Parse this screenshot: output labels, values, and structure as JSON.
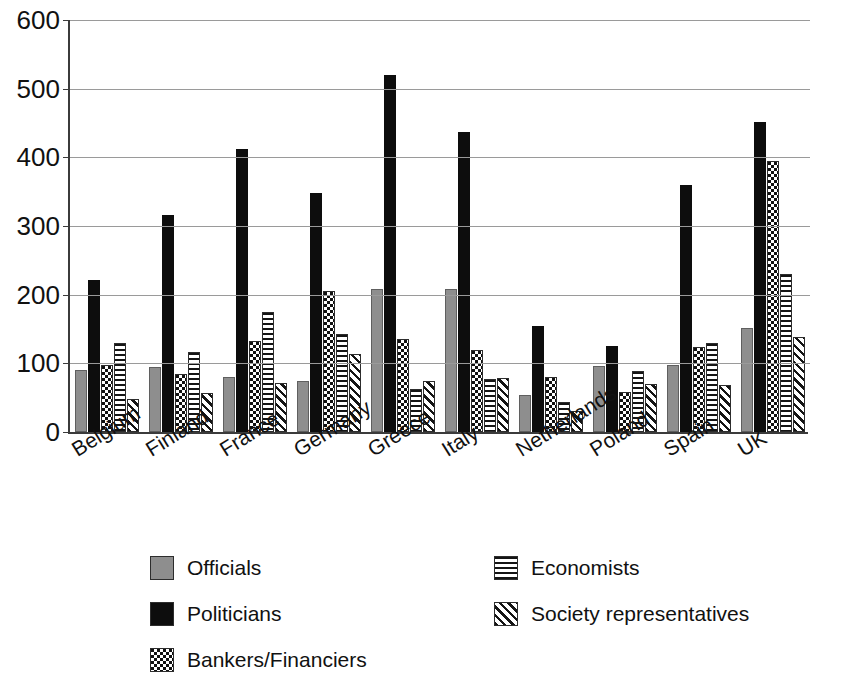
{
  "chart_data": {
    "type": "bar",
    "title": "",
    "subtitle": "",
    "xlabel": "",
    "ylabel": "",
    "ylim": [
      0,
      600
    ],
    "ytick_step": 100,
    "yticks": [
      0,
      100,
      200,
      300,
      400,
      500,
      600
    ],
    "ytick_labels": [
      "0",
      "100",
      "200",
      "300",
      "400",
      "500",
      "600"
    ],
    "grid": "horizontal",
    "legend_position": "bottom",
    "orientation": "vertical",
    "categories": [
      "Belgium",
      "Finland",
      "France",
      "Germany",
      "Greece",
      "Italy",
      "Netherlands",
      "Poland",
      "Spain",
      "UK"
    ],
    "series": [
      {
        "name": "Officials",
        "pattern": "solid-gray",
        "color": "#8e8e8e",
        "values": [
          90,
          94,
          80,
          74,
          208,
          208,
          54,
          96,
          98,
          152
        ]
      },
      {
        "name": "Politicians",
        "pattern": "solid-black",
        "color": "#0d0d0d",
        "values": [
          222,
          316,
          412,
          348,
          520,
          437,
          155,
          125,
          360,
          452
        ]
      },
      {
        "name": "Bankers/Financiers",
        "pattern": "dotted",
        "color": "#111111",
        "values": [
          97,
          85,
          133,
          206,
          136,
          120,
          80,
          59,
          124,
          395
        ]
      },
      {
        "name": "Economists",
        "pattern": "horizontal-lines",
        "color": "#141414",
        "values": [
          130,
          117,
          175,
          143,
          62,
          77,
          43,
          89,
          130,
          230
        ]
      },
      {
        "name": "Society representatives",
        "pattern": "diagonal-hatch",
        "color": "#141414",
        "values": [
          48,
          57,
          72,
          113,
          75,
          78,
          31,
          70,
          69,
          139
        ]
      }
    ]
  },
  "legend": {
    "items": [
      {
        "label": "Officials",
        "swatch": "solid-gray"
      },
      {
        "label": "Politicians",
        "swatch": "solid-black"
      },
      {
        "label": "Bankers/Financiers",
        "swatch": "dotted"
      },
      {
        "label": "Economists",
        "swatch": "horizontal-lines"
      },
      {
        "label": "Society representatives",
        "swatch": "diagonal-hatch"
      }
    ]
  },
  "colors": {
    "officials": "#8e8e8e",
    "politicians": "#0d0d0d",
    "gridline": "#9a9a9a",
    "axis": "#3b3b3b",
    "background": "#ffffff",
    "text": "#111111"
  }
}
